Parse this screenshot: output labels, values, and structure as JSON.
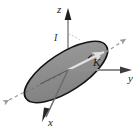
{
  "figure": {
    "background_color": "#ffffff",
    "labels": {
      "z_axis": "z",
      "y_axis": "y",
      "x_axis": "x",
      "angular_momentum": "K",
      "inclination_angle": "I"
    },
    "colors": {
      "disk_fill": "#8c8c8c",
      "disk_edge": "#1a1a1a",
      "axis": "#8a8a8a",
      "axis_head": "#3a3a3a",
      "dashed_node_line": "#9a9a9a",
      "inner_arrow": "#d9d9d9",
      "text": "#1a1a1a"
    },
    "geometry": {
      "origin": {
        "x": 68,
        "y": 70
      },
      "disk_center": {
        "x": 66,
        "y": 72
      },
      "disk_semi_major": 48,
      "disk_semi_minor": 19,
      "disk_rotation_deg": -33,
      "z_axis_tip": {
        "x": 68,
        "y": 10
      },
      "y_axis_tip": {
        "x": 131,
        "y": 70
      },
      "x_axis_tip": {
        "x": 42,
        "y": 121
      },
      "k_vector_tip": {
        "x": 122,
        "y": 32
      },
      "node_line_start": {
        "x": 9,
        "y": 100
      },
      "node_line_end": {
        "x": 126,
        "y": 40
      }
    }
  }
}
